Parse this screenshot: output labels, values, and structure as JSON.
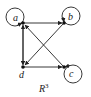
{
  "diagram": {
    "title": "R3",
    "title_base": "R",
    "title_sup": "3",
    "nodes": [
      {
        "id": "a",
        "label": "a",
        "x": 23,
        "y": 23,
        "self_loop": true
      },
      {
        "id": "b",
        "label": "b",
        "x": 64,
        "y": 23,
        "self_loop": true
      },
      {
        "id": "c",
        "label": "c",
        "x": 64,
        "y": 67,
        "self_loop": true
      },
      {
        "id": "d",
        "label": "d",
        "x": 23,
        "y": 67,
        "self_loop": false
      }
    ],
    "edges": [
      {
        "from": "a",
        "to": "b"
      },
      {
        "from": "a",
        "to": "d"
      },
      {
        "from": "d",
        "to": "a"
      },
      {
        "from": "b",
        "to": "d"
      },
      {
        "from": "c",
        "to": "a"
      },
      {
        "from": "d",
        "to": "c"
      }
    ],
    "colors": {
      "stroke": "#222222",
      "background": "#ffffff"
    }
  }
}
